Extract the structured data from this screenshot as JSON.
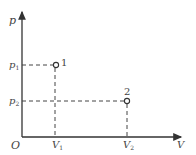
{
  "diagram": {
    "type": "p-V state diagram",
    "axes": {
      "origin_label": "O",
      "x_label": "V",
      "y_label": "p",
      "x_ticks": [
        {
          "label": "V",
          "sub": "1"
        },
        {
          "label": "V",
          "sub": "2"
        }
      ],
      "y_ticks": [
        {
          "label": "p",
          "sub": "1"
        },
        {
          "label": "p",
          "sub": "2"
        }
      ]
    },
    "points": [
      {
        "name": "1",
        "x": "V1",
        "y": "p1"
      },
      {
        "name": "2",
        "x": "V2",
        "y": "p2"
      }
    ],
    "colors": {
      "axis": "#333333",
      "dashed": "#444444",
      "text": "#444444"
    }
  }
}
